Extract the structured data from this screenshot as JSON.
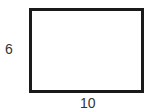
{
  "diagram": {
    "shape": "rectangle",
    "height_label": "6",
    "width_label": "10",
    "stroke_color": "#1a1a1a",
    "label_color": "#333333"
  }
}
